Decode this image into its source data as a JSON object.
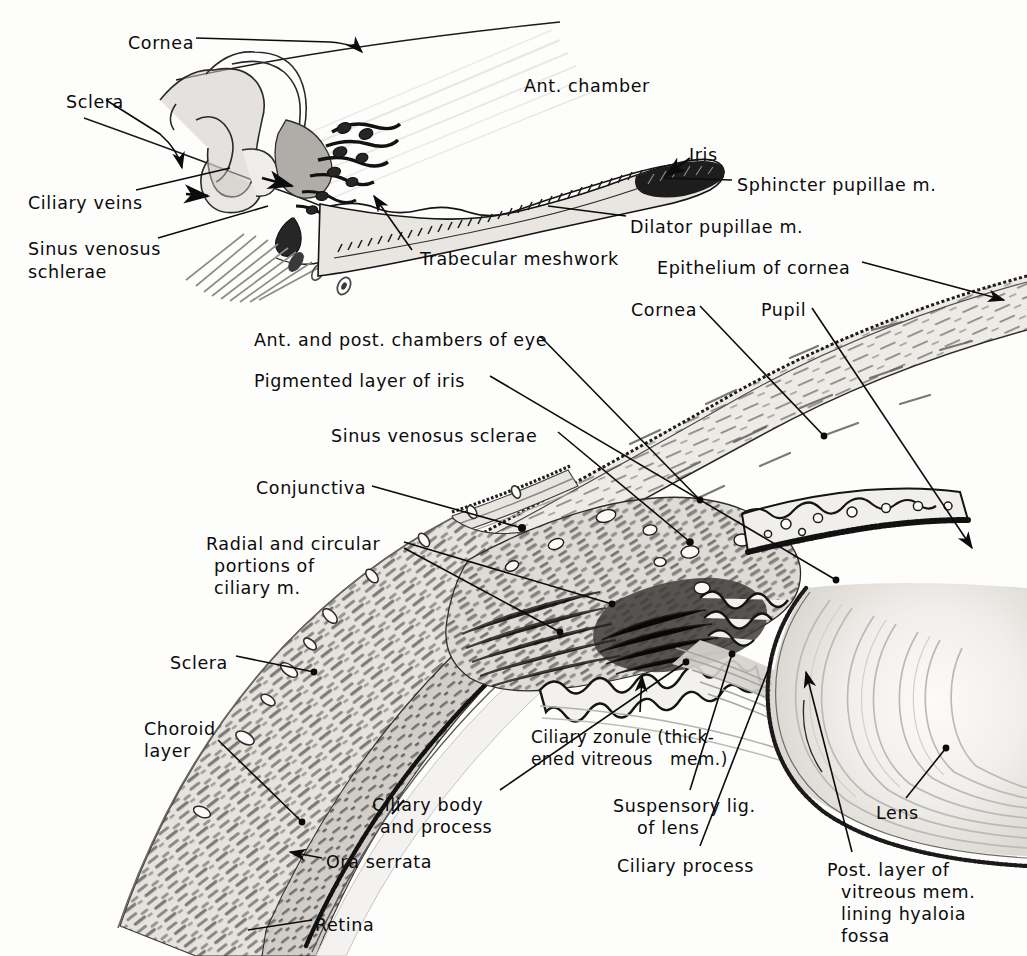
{
  "plate": {
    "title": "Anatomy of the eye — anterior segment and ciliary region",
    "width": 1027,
    "height": 956,
    "background_color": "#fdfdfc",
    "ink_color": "#0b0b0b",
    "style": "hand-lettered halftone anatomical line drawing"
  },
  "panels": [
    {
      "id": "upper",
      "name": "iridocorneal angle detail"
    },
    {
      "id": "lower",
      "name": "sagittal section through ciliary body, lens and cornea"
    }
  ],
  "labels": {
    "upper": [
      {
        "key": "cornea",
        "text": "Cornea",
        "x": 128,
        "y": 33,
        "align": "left"
      },
      {
        "key": "sclera",
        "text": "Sclera",
        "x": 66,
        "y": 92,
        "align": "left"
      },
      {
        "key": "ciliary_veins",
        "text": "Ciliary veins",
        "x": 28,
        "y": 193,
        "align": "left"
      },
      {
        "key": "sinus_venosus_1",
        "text": "Sinus venosus",
        "x": 28,
        "y": 239,
        "align": "left"
      },
      {
        "key": "sinus_venosus_2",
        "text": "schlerae",
        "x": 28,
        "y": 262,
        "align": "left"
      },
      {
        "key": "ant_chamber",
        "text": "Ant. chamber",
        "x": 524,
        "y": 76,
        "align": "left"
      },
      {
        "key": "iris",
        "text": "Iris",
        "x": 689,
        "y": 145,
        "align": "left"
      },
      {
        "key": "sphincter",
        "text": "Sphincter pupillae m.",
        "x": 737,
        "y": 175,
        "align": "left"
      },
      {
        "key": "dilator",
        "text": "Dilator pupillae m.",
        "x": 630,
        "y": 217,
        "align": "left"
      },
      {
        "key": "trabecular",
        "text": "Trabecular meshwork",
        "x": 420,
        "y": 249,
        "align": "left"
      }
    ],
    "lower": [
      {
        "key": "epithelium",
        "text": "Epithelium of cornea",
        "x": 657,
        "y": 258,
        "align": "left"
      },
      {
        "key": "cornea2",
        "text": "Cornea",
        "x": 631,
        "y": 300,
        "align": "left"
      },
      {
        "key": "pupil",
        "text": "Pupil",
        "x": 761,
        "y": 300,
        "align": "left"
      },
      {
        "key": "chambers",
        "text": "Ant. and post. chambers of eye",
        "x": 254,
        "y": 330,
        "align": "left"
      },
      {
        "key": "pigmented",
        "text": "Pigmented layer of iris",
        "x": 254,
        "y": 371,
        "align": "left"
      },
      {
        "key": "sinus_venosus_low",
        "text": "Sinus venosus sclerae",
        "x": 331,
        "y": 426,
        "align": "left"
      },
      {
        "key": "conjunctiva",
        "text": "Conjunctiva",
        "x": 256,
        "y": 478,
        "align": "left"
      },
      {
        "key": "ciliary_m_1",
        "text": "Radial and circular",
        "x": 206,
        "y": 534,
        "align": "left"
      },
      {
        "key": "ciliary_m_2",
        "text": "portions of",
        "x": 214,
        "y": 556,
        "align": "left"
      },
      {
        "key": "ciliary_m_3",
        "text": "ciliary m.",
        "x": 214,
        "y": 578,
        "align": "left"
      },
      {
        "key": "sclera_low",
        "text": "Sclera",
        "x": 170,
        "y": 653,
        "align": "left"
      },
      {
        "key": "choroid_1",
        "text": "Choroid",
        "x": 144,
        "y": 719,
        "align": "left"
      },
      {
        "key": "choroid_2",
        "text": "layer",
        "x": 144,
        "y": 741,
        "align": "left"
      },
      {
        "key": "zonule_1",
        "text": "Ciliary zonule (thick-",
        "x": 531,
        "y": 727,
        "align": "left"
      },
      {
        "key": "zonule_2",
        "text": "ened vitreous   mem.)",
        "x": 531,
        "y": 749,
        "align": "left"
      },
      {
        "key": "ciliary_body_1",
        "text": "Ciliary body",
        "x": 372,
        "y": 795,
        "align": "left"
      },
      {
        "key": "ciliary_body_2",
        "text": "and process",
        "x": 380,
        "y": 817,
        "align": "left"
      },
      {
        "key": "suspensory_1",
        "text": "Suspensory lig.",
        "x": 613,
        "y": 796,
        "align": "left"
      },
      {
        "key": "suspensory_2",
        "text": "of lens",
        "x": 637,
        "y": 818,
        "align": "left"
      },
      {
        "key": "lens",
        "text": "Lens",
        "x": 876,
        "y": 803,
        "align": "left"
      },
      {
        "key": "ora_serrata",
        "text": "Ora serrata",
        "x": 326,
        "y": 852,
        "align": "left"
      },
      {
        "key": "ciliary_process",
        "text": "Ciliary process",
        "x": 617,
        "y": 856,
        "align": "left"
      },
      {
        "key": "post_layer_1",
        "text": "Post. layer of",
        "x": 827,
        "y": 860,
        "align": "left"
      },
      {
        "key": "post_layer_2",
        "text": "vitreous mem.",
        "x": 841,
        "y": 882,
        "align": "left"
      },
      {
        "key": "post_layer_3",
        "text": "lining hyaloia",
        "x": 841,
        "y": 904,
        "align": "left"
      },
      {
        "key": "post_layer_4",
        "text": "fossa",
        "x": 841,
        "y": 926,
        "align": "left"
      },
      {
        "key": "retina",
        "text": "Retina",
        "x": 315,
        "y": 915,
        "align": "left"
      }
    ]
  },
  "structures": {
    "upper": [
      "ciliary veins loops",
      "sinus venosus schlerae",
      "trabecular meshwork",
      "iris with sphincter and dilator pupillae",
      "anterior chamber",
      "sclera",
      "cornea"
    ],
    "lower": [
      "cornea with epithelium",
      "conjunctiva",
      "sinus venosus sclerae",
      "ciliary muscle radial and circular",
      "ciliary processes",
      "iris pigmented layer",
      "lens with lamellae",
      "suspensory ligament / ciliary zonule",
      "sclera",
      "choroid layer",
      "retina",
      "ora serrata",
      "posterior vitreous membrane"
    ]
  }
}
